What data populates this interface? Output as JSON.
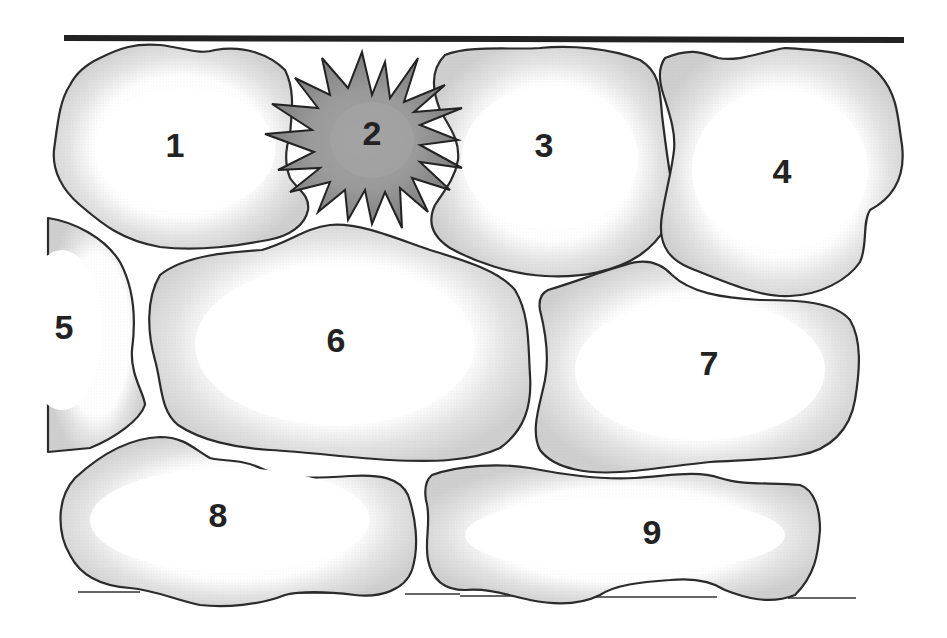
{
  "diagram": {
    "type": "cell-arrangement",
    "colors": {
      "cell_outline": "#2a2a2a",
      "cell_fill_edge": "#d6d6d6",
      "cell_fill_center": "#ffffff",
      "spiky_cell_fill": "#8c8c8c",
      "spiky_cell_center": "#a0a0a0",
      "top_line": "#222222",
      "label": "#222222"
    },
    "cells": [
      {
        "id": "1",
        "label": "1",
        "x": 175,
        "y": 148,
        "kind": "normal"
      },
      {
        "id": "2",
        "label": "2",
        "x": 372,
        "y": 136,
        "kind": "spiky"
      },
      {
        "id": "3",
        "label": "3",
        "x": 544,
        "y": 148,
        "kind": "normal"
      },
      {
        "id": "4",
        "label": "4",
        "x": 782,
        "y": 174,
        "kind": "normal"
      },
      {
        "id": "5",
        "label": "5",
        "x": 64,
        "y": 330,
        "kind": "partial"
      },
      {
        "id": "6",
        "label": "6",
        "x": 336,
        "y": 343,
        "kind": "normal"
      },
      {
        "id": "7",
        "label": "7",
        "x": 709,
        "y": 366,
        "kind": "normal"
      },
      {
        "id": "8",
        "label": "8",
        "x": 218,
        "y": 518,
        "kind": "normal"
      },
      {
        "id": "9",
        "label": "9",
        "x": 652,
        "y": 535,
        "kind": "normal"
      }
    ]
  }
}
